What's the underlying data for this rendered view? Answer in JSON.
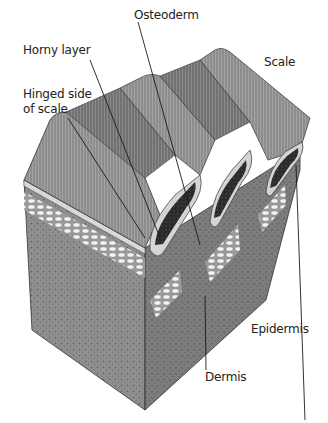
{
  "diagram": {
    "labels": {
      "osteoderm": "Osteoderm",
      "horny_layer": "Horny layer",
      "hinged_side_line1": "Hinged side",
      "hinged_side_line2": "of scale",
      "scale": "Scale",
      "epidermis": "Epidermis",
      "dermis": "Dermis"
    },
    "colors": {
      "background": "#ffffff",
      "dermis": "#8d8d8d",
      "dermis_dark": "#6f6f6f",
      "horny_layer": "#9a9a9a",
      "horny_dark": "#7a7a7a",
      "osteoderm": "#2a2a2a",
      "epidermis": "#d6d6d6",
      "fat_cells": "#f2f2f2",
      "leader": "#1a1a1a",
      "text": "#222222"
    }
  }
}
